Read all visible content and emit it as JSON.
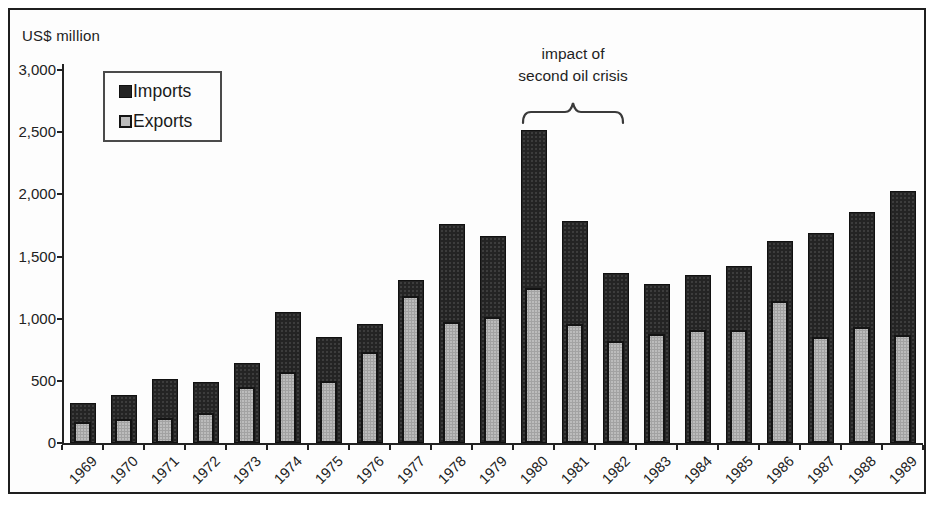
{
  "figure": {
    "y_axis_title": "US$ million",
    "legend": {
      "imports_label": "Imports",
      "exports_label": "Exports"
    },
    "annotation": {
      "line1": "impact of",
      "line2": "second oil crisis"
    }
  },
  "chart_data": {
    "type": "bar",
    "subtype": "overlay-stacked (exports bar drawn inside imports bar)",
    "title": "",
    "ylabel": "US$ million",
    "xlabel": "",
    "ylim": [
      0,
      3000
    ],
    "ytick_values": [
      0,
      500,
      1000,
      1500,
      2000,
      2500,
      3000
    ],
    "ytick_labels": [
      "0",
      "500",
      "1,000",
      "1,500",
      "2,000",
      "2,500",
      "3,000"
    ],
    "grid": false,
    "legend_position": "upper-left",
    "categories": [
      "1969",
      "1970",
      "1971",
      "1972",
      "1973",
      "1974",
      "1975",
      "1976",
      "1977",
      "1978",
      "1979",
      "1980",
      "1981",
      "1982",
      "1983",
      "1984",
      "1985",
      "1986",
      "1987",
      "1988",
      "1989"
    ],
    "series": [
      {
        "name": "Imports",
        "color": "#242424",
        "values": [
          325,
          390,
          515,
          490,
          645,
          1055,
          855,
          960,
          1315,
          1760,
          1665,
          2515,
          1785,
          1370,
          1280,
          1350,
          1425,
          1625,
          1690,
          1855,
          2030
        ]
      },
      {
        "name": "Exports",
        "color": "#bcbcbc",
        "values": [
          165,
          190,
          200,
          240,
          450,
          570,
          495,
          735,
          1180,
          975,
          1015,
          1250,
          955,
          820,
          875,
          910,
          910,
          1140,
          855,
          930,
          865
        ]
      }
    ],
    "annotation": {
      "text": "impact of second oil crisis",
      "span_categories": [
        "1980",
        "1982"
      ]
    }
  }
}
